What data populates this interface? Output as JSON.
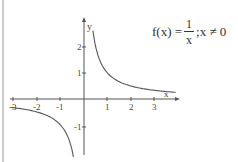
{
  "chart_data": {
    "type": "line",
    "function": "1/x",
    "xlabel": "x",
    "ylabel": "y",
    "xlim": [
      -3,
      3.7
    ],
    "ylim": [
      -1.7,
      2.4
    ],
    "x_ticks": [
      -3,
      -2,
      -1,
      1,
      2,
      3
    ],
    "y_ticks": [
      -1,
      1,
      2
    ],
    "x_tick_labels": [
      "-3",
      "-2",
      "-1",
      "1",
      "2",
      "3"
    ],
    "y_tick_labels": [
      "-1",
      "1",
      "2"
    ],
    "grid": false,
    "series": [
      {
        "name": "x>0 branch",
        "x": [
          0.4,
          0.5,
          0.75,
          1,
          1.5,
          2,
          2.5,
          3,
          3.5,
          3.7
        ],
        "y": [
          2.5,
          2,
          1.333,
          1,
          0.667,
          0.5,
          0.4,
          0.333,
          0.286,
          0.27
        ]
      },
      {
        "name": "x<0 branch",
        "x": [
          -3,
          -2.5,
          -2,
          -1.5,
          -1,
          -0.75,
          -0.6
        ],
        "y": [
          -0.333,
          -0.4,
          -0.5,
          -0.667,
          -1,
          -1.333,
          -1.667
        ]
      }
    ]
  },
  "formula": {
    "lhs": "f(x) =",
    "numerator": "1",
    "denominator": "x",
    "condition": ";x ≠ 0"
  },
  "axis_labels": {
    "x": "x",
    "y": "y"
  },
  "ticks": {
    "x": [
      {
        "label": "-3",
        "px": 13
      },
      {
        "label": "-2",
        "px": 37
      },
      {
        "label": "-1",
        "px": 60
      },
      {
        "label": "1",
        "px": 107
      },
      {
        "label": "2",
        "px": 131
      },
      {
        "label": "3",
        "px": 154
      }
    ],
    "y": [
      {
        "label": "2",
        "py": 47
      },
      {
        "label": "1",
        "py": 73
      },
      {
        "label": "-1",
        "py": 127
      }
    ]
  },
  "colors": {
    "axis": "#555555",
    "curve": "#555555",
    "text": "#333333",
    "border": "#888888"
  }
}
